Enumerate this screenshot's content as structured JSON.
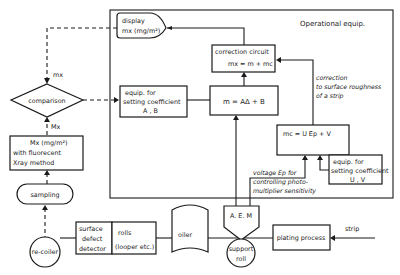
{
  "diagram": {
    "operational_box_label": "Operational equip.",
    "display": {
      "line1": "display",
      "line2": "mx (mg/m²)"
    },
    "correction_circuit": {
      "line1": "correction circuit",
      "line2": "mx = m + mc"
    },
    "equation_m": "m = AΔ + B",
    "equation_mc": "mc = U Ep + V",
    "coef_AB": {
      "line1": "equip. for",
      "line2": "setting coefficient",
      "line3": "A , B"
    },
    "coef_UV": {
      "line1": "equip. for",
      "line2": "setting coefficient",
      "line3": "U , V"
    },
    "correction_note": {
      "line1": "correction",
      "line2": "to surface roughness",
      "line3": "of a strip"
    },
    "voltage_note": {
      "line1": "voltage Ep for",
      "line2": "controlling photo-",
      "line3": "multiplier sensitivity"
    },
    "comparison": "comparison",
    "label_mx": "mx",
    "label_Mx": "Mx",
    "fluorescent": {
      "line1": "Mx (mg/m²)",
      "line2": "with fluorecent",
      "line3": "Xray method"
    },
    "sampling": "sampling",
    "recoiler": "re-coiler",
    "surface_detector": {
      "line1": "surface",
      "line2": "defect",
      "line3": "detector"
    },
    "rolls": {
      "line1": "rolls",
      "line2": "(looper etc.)"
    },
    "oiler": "oiler",
    "aem": "A. E. M",
    "support_roll": {
      "line1": "support",
      "line2": "roll"
    },
    "plating": "plating process",
    "strip": "strip"
  }
}
